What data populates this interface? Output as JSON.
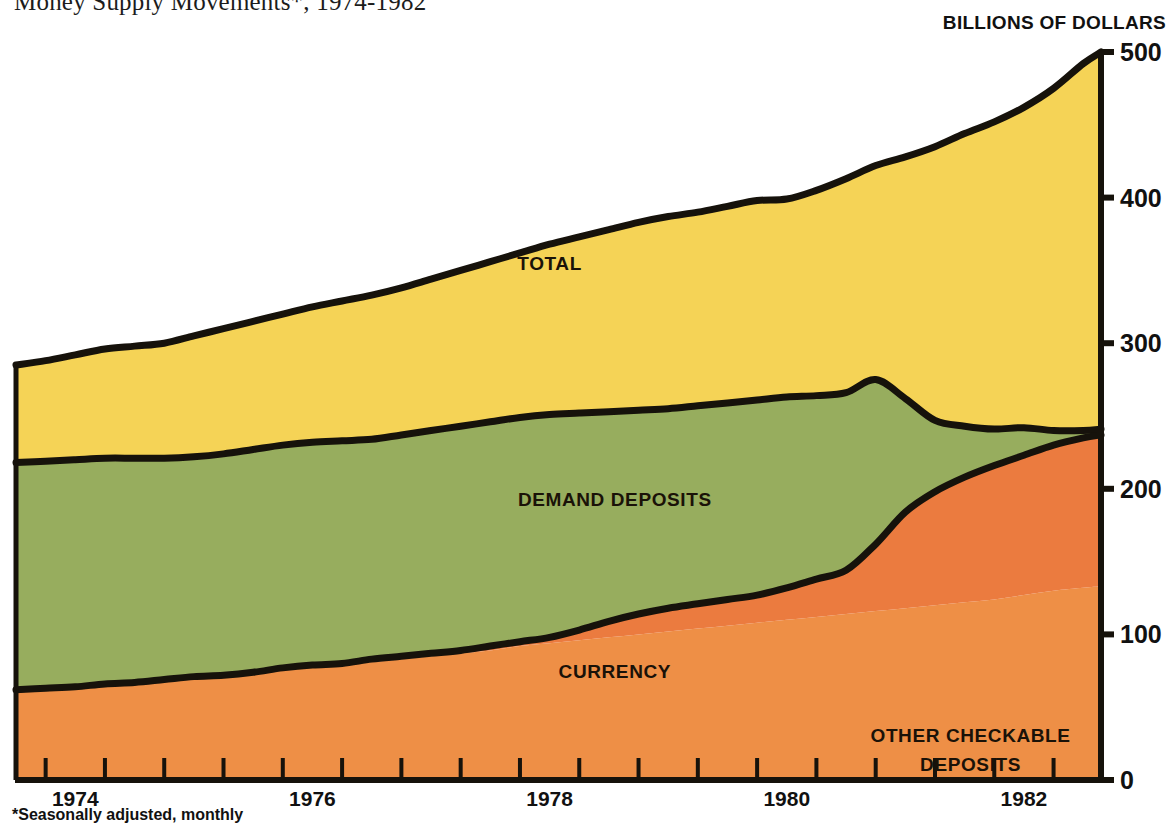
{
  "title": "Money Supply Movements*, 1974-1982",
  "y_axis_caption": "BILLIONS OF DOLLARS",
  "footnote": "*Seasonally adjusted, monthly",
  "colors": {
    "total": "#F5D356",
    "demand_deposits": "#97AD5E",
    "currency": "#EE8F46",
    "other_checkable_deposits": "#EB7B3F",
    "outline": "#16120B",
    "axis": "#16120B",
    "text": "#111111"
  },
  "chart_data": {
    "type": "area",
    "stacked": true,
    "title": "Money Supply Movements*, 1974-1982",
    "xlabel": "",
    "ylabel": "BILLIONS OF DOLLARS",
    "xlim": [
      1973.75,
      1982.9
    ],
    "ylim": [
      0,
      500
    ],
    "grid": false,
    "legend": "inline-band-labels",
    "y_ticks": [
      0,
      100,
      200,
      300,
      400,
      500
    ],
    "x_ticks": [
      1974,
      1976,
      1978,
      1980,
      1982
    ],
    "x_tick_labels": [
      "1974",
      "1976",
      "1978",
      "1980",
      "1982"
    ],
    "x_minor_tick_interval_years": 0.5,
    "band_labels": [
      {
        "name": "TOTAL",
        "x": 1978.25,
        "y": 350
      },
      {
        "name": "DEMAND DEPOSITS",
        "x": 1978.8,
        "y": 188
      },
      {
        "name": "CURRENCY",
        "x": 1978.8,
        "y": 70
      },
      {
        "name": "OTHER CHECKABLE DEPOSITS",
        "x": 1981.8,
        "y": 26
      }
    ],
    "x": [
      1973.75,
      1974.0,
      1974.25,
      1974.5,
      1974.75,
      1975.0,
      1975.25,
      1975.5,
      1975.75,
      1976.0,
      1976.25,
      1976.5,
      1976.75,
      1977.0,
      1977.25,
      1977.5,
      1977.75,
      1978.0,
      1978.25,
      1978.5,
      1978.75,
      1979.0,
      1979.25,
      1979.5,
      1979.75,
      1980.0,
      1980.25,
      1980.5,
      1980.75,
      1981.0,
      1981.25,
      1981.5,
      1981.75,
      1982.0,
      1982.25,
      1982.5,
      1982.75,
      1982.9
    ],
    "series": [
      {
        "name": "CURRENCY",
        "color": "#EE8F46",
        "values": [
          62,
          63,
          64,
          66,
          67,
          69,
          71,
          72,
          74,
          76,
          78,
          79,
          81,
          83,
          85,
          87,
          89,
          92,
          94,
          96,
          98,
          100,
          102,
          104,
          106,
          108,
          110,
          112,
          114,
          116,
          118,
          120,
          122,
          124,
          127,
          130,
          132,
          133
        ]
      },
      {
        "name": "OTHER CHECKABLE DEPOSITS",
        "color": "#EB7B3F",
        "values": [
          0,
          0,
          0,
          0,
          0,
          0,
          0,
          0,
          0,
          1,
          1,
          1,
          2,
          2,
          2,
          2,
          3,
          3,
          4,
          7,
          11,
          14,
          16,
          17,
          18,
          19,
          22,
          26,
          30,
          46,
          66,
          78,
          86,
          92,
          96,
          100,
          103,
          104
        ]
      },
      {
        "name": "DEMAND DEPOSITS",
        "color": "#97AD5E",
        "values": [
          218,
          219,
          220,
          221,
          221,
          221,
          222,
          224,
          227,
          230,
          232,
          233,
          234,
          237,
          240,
          243,
          246,
          249,
          251,
          252,
          253,
          254,
          255,
          257,
          259,
          261,
          263,
          264,
          266,
          275,
          262,
          247,
          243,
          241,
          242,
          240,
          240,
          241
        ]
      },
      {
        "name": "TOTAL",
        "color": "#F5D356",
        "values": [
          285,
          288,
          292,
          296,
          298,
          300,
          305,
          310,
          315,
          320,
          325,
          329,
          333,
          338,
          344,
          350,
          356,
          362,
          368,
          373,
          378,
          383,
          387,
          390,
          394,
          398,
          399,
          405,
          413,
          422,
          428,
          435,
          444,
          452,
          462,
          475,
          492,
          500
        ]
      }
    ],
    "note": "Values are approximate readings of the stacked bands; TOTAL is the topmost boundary of the stack (M1-style aggregate), bands stack bottom-up as CURRENCY, OTHER CHECKABLE DEPOSITS, DEMAND DEPOSITS, then the remaining yellow area up to TOTAL."
  }
}
